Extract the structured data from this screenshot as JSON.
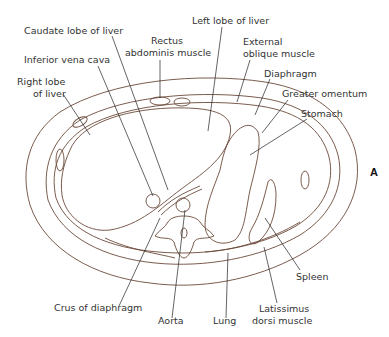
{
  "figure": {
    "panel_letter": "A",
    "labels": {
      "caudate_lobe": "Caudate lobe of liver",
      "ivc": "Inferior vena cava",
      "right_lobe_1": "Right lobe",
      "right_lobe_2": "of liver",
      "rectus_1": "Rectus",
      "rectus_2": "abdominis muscle",
      "left_lobe": "Left lobe of liver",
      "ext_oblique_1": "External",
      "ext_oblique_2": "oblique muscle",
      "diaphragm": "Diaphragm",
      "greater_omentum": "Greater omentum",
      "stomach": "Stomach",
      "spleen": "Spleen",
      "crus": "Crus of diaphragm",
      "aorta": "Aorta",
      "lung": "Lung",
      "latissimus_1": "Latissimus",
      "latissimus_2": "dorsi muscle"
    }
  }
}
